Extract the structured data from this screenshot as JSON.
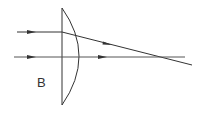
{
  "diagram": {
    "type": "optics-ray-diagram",
    "label": "B",
    "colors": {
      "ink": "#333333",
      "background": "#ffffff"
    },
    "lens": {
      "kind": "plano-convex",
      "flat_x": 62,
      "top_y": 8,
      "bottom_y": 105,
      "bulge_x": 79
    },
    "rays": [
      {
        "name": "upper-ray",
        "path": [
          [
            17,
            32
          ],
          [
            62,
            32
          ],
          [
            192,
            65
          ]
        ]
      },
      {
        "name": "axis-ray",
        "path": [
          [
            14,
            57
          ],
          [
            185,
            57
          ]
        ]
      }
    ]
  }
}
